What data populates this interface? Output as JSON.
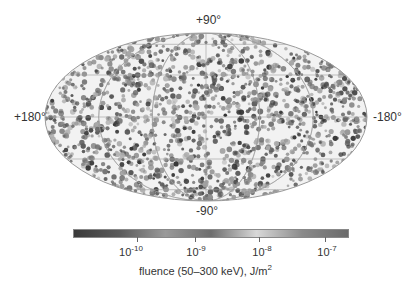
{
  "chart_data": {
    "type": "heatmap",
    "projection": "Aitoff/Hammer all-sky (galactic coordinates)",
    "title": "",
    "map": {
      "lat_labels": {
        "top": "+90°",
        "bottom": "-90°"
      },
      "lon_labels": {
        "left": "+180°",
        "right": "-180°"
      },
      "grid": true,
      "description": "Isotropic all-sky distribution of burst sources; grayscale dots by fluence"
    },
    "colorbar": {
      "label": "fluence (50–300 keV), J/m²",
      "label_base": "fluence (50–300 keV), J/m",
      "label_exp": "2",
      "scale": "log",
      "ticks": [
        {
          "base": "10",
          "exp": "-10",
          "value": 1e-10
        },
        {
          "base": "10",
          "exp": "-9",
          "value": 1e-09
        },
        {
          "base": "10",
          "exp": "-8",
          "value": 1e-08
        },
        {
          "base": "10",
          "exp": "-7",
          "value": 1e-07
        }
      ],
      "gradient": [
        "#3a3a3a",
        "#5a5a5a",
        "#9a9a9a",
        "#6e6e6e",
        "#d8d8d8",
        "#8a8a8a",
        "#6a6a6a"
      ]
    }
  },
  "colors": {
    "background": "#ffffff",
    "grid": "#9a9a9a",
    "dot_dark": "#3a3a3a",
    "dot_light": "#b0b0b0"
  }
}
